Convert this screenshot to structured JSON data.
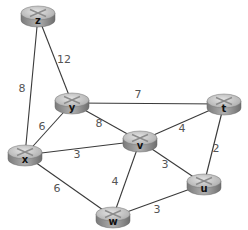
{
  "diagram": {
    "type": "weighted-network-graph",
    "node_style": "router",
    "colors": {
      "router_top": "#c8c8c8",
      "router_side": "#8a8a8a",
      "edge": "#3a3a3a",
      "weight_text": "#555555"
    },
    "nodes": [
      {
        "id": "z",
        "label": "z"
      },
      {
        "id": "y",
        "label": "y"
      },
      {
        "id": "t",
        "label": "t"
      },
      {
        "id": "x",
        "label": "x"
      },
      {
        "id": "v",
        "label": "v"
      },
      {
        "id": "u",
        "label": "u"
      },
      {
        "id": "w",
        "label": "w"
      }
    ],
    "edges": [
      {
        "from": "z",
        "to": "x",
        "weight": "8"
      },
      {
        "from": "z",
        "to": "y",
        "weight": "12"
      },
      {
        "from": "y",
        "to": "t",
        "weight": "7"
      },
      {
        "from": "y",
        "to": "x",
        "weight": "6"
      },
      {
        "from": "y",
        "to": "v",
        "weight": "8"
      },
      {
        "from": "x",
        "to": "v",
        "weight": "3"
      },
      {
        "from": "x",
        "to": "w",
        "weight": "6"
      },
      {
        "from": "v",
        "to": "t",
        "weight": "4"
      },
      {
        "from": "v",
        "to": "u",
        "weight": "3"
      },
      {
        "from": "v",
        "to": "w",
        "weight": "4"
      },
      {
        "from": "t",
        "to": "u",
        "weight": "2"
      },
      {
        "from": "w",
        "to": "u",
        "weight": "3"
      }
    ]
  }
}
